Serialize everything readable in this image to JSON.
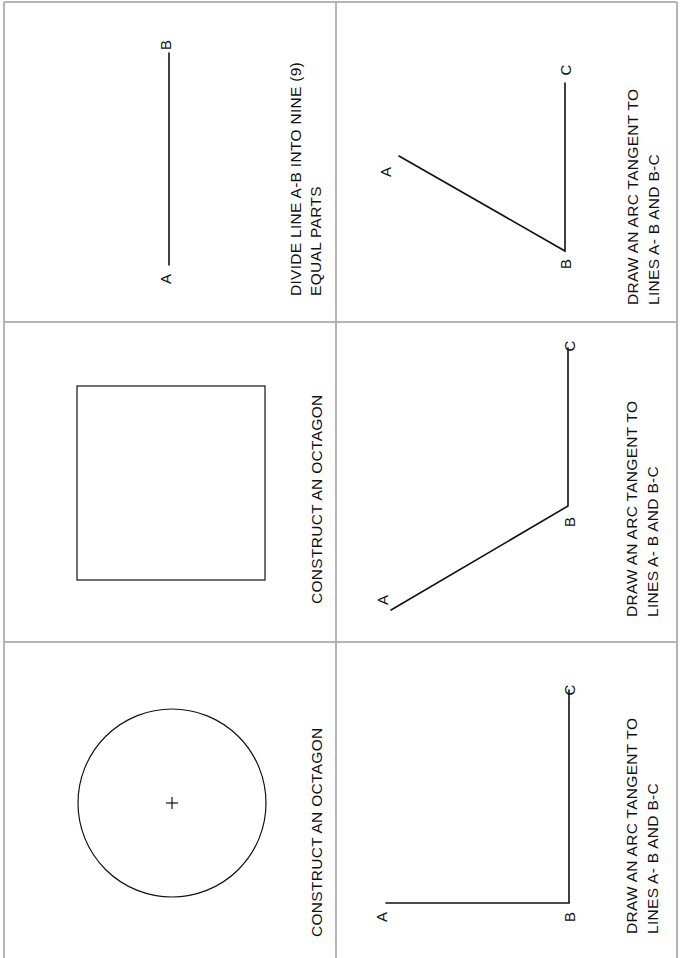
{
  "sheet": {
    "orientation": "rotated 90deg counter-clockwise",
    "grid": {
      "rows": 3,
      "columns": 2,
      "line_color": "#b4b4b4"
    },
    "ink_color": "#111111"
  },
  "cells": [
    {
      "id": "r1c1",
      "figure": "line",
      "labels": {
        "start": "A",
        "end": "B"
      },
      "instruction": [
        "DIVIDE LINE  A-B INTO NINE (9)",
        "EQUAL  PARTS"
      ]
    },
    {
      "id": "r1c2",
      "figure": "angle-acute",
      "labels": {
        "a": "A",
        "b": "B",
        "c": "C"
      },
      "instruction": [
        "DRAW  AN  ARC TANGENT  TO",
        "LINES  A- B  AND  B-C"
      ]
    },
    {
      "id": "r2c1",
      "figure": "square",
      "instruction": [
        "CONSTRUCT  AN  OCTAGON"
      ]
    },
    {
      "id": "r2c2",
      "figure": "angle-obtuse",
      "labels": {
        "a": "A",
        "b": "B",
        "c": "C"
      },
      "instruction": [
        "DRAW  AN  ARC  TANGENT  TO",
        "LINES  A- B  AND  B-C"
      ]
    },
    {
      "id": "r3c1",
      "figure": "circle-with-center-mark",
      "instruction": [
        "CONSTRUCT  AN  OCTAGON"
      ]
    },
    {
      "id": "r3c2",
      "figure": "angle-right",
      "labels": {
        "a": "A",
        "b": "B",
        "c": "C"
      },
      "instruction": [
        "DRAW  AN  ARC  TANGENT  TO",
        "LINES  A- B  AND  B-C"
      ]
    }
  ]
}
